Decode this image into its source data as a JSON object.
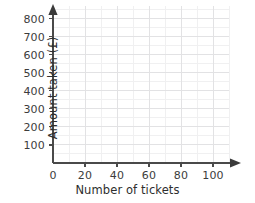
{
  "chart_data": {
    "type": "scatter",
    "title": "",
    "subtitle": "",
    "xlabel": "Number of tickets",
    "ylabel": "Amount taken (£)",
    "xlim": [
      0,
      110
    ],
    "ylim": [
      0,
      870
    ],
    "x_ticks": [
      0,
      20,
      40,
      60,
      80,
      100
    ],
    "x_tick_labels": [
      "0",
      "20",
      "40",
      "60",
      "80",
      "100"
    ],
    "y_ticks": [
      100,
      200,
      300,
      400,
      500,
      600,
      700,
      800
    ],
    "y_tick_labels": [
      "100",
      "200",
      "300",
      "400",
      "500",
      "600",
      "700",
      "800"
    ],
    "origin_label": "0",
    "x_minor_step": 10,
    "y_minor_step": 50,
    "grid": true,
    "grid_major_color": "#e2e2e4",
    "grid_minor_color": "#f0f0f1",
    "axis_color": "#4a4a4a",
    "background_color": "#ffffff",
    "legend": [],
    "annotations": [],
    "series": [],
    "values": [],
    "categories": []
  },
  "axes": {
    "x_title": "Number of tickets",
    "y_title": "Amount taken (£)",
    "origin": "0",
    "x_labels": [
      "20",
      "40",
      "60",
      "80",
      "100"
    ],
    "y_labels": [
      "800",
      "700",
      "600",
      "500",
      "400",
      "300",
      "200",
      "100"
    ]
  }
}
